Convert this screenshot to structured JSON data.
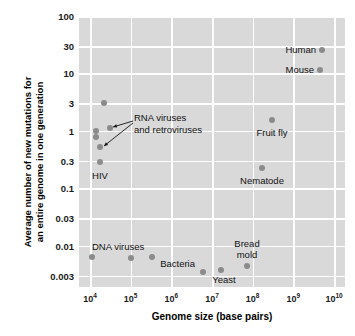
{
  "chart_data": {
    "type": "scatter",
    "title": "",
    "xlabel": "Genome size (base pairs)",
    "ylabel_line1": "Average number of new mutations for",
    "ylabel_line2": "an entire genome in one generation",
    "xscale": "log",
    "yscale": "log",
    "xlim": [
      10000,
      10000000000
    ],
    "ylim": [
      0.0019,
      100
    ],
    "grid": true,
    "legend": "none",
    "xticks": [
      {
        "label": "10",
        "exp": "4",
        "value": 10000
      },
      {
        "label": "10",
        "exp": "5",
        "value": 100000
      },
      {
        "label": "10",
        "exp": "6",
        "value": 1000000
      },
      {
        "label": "10",
        "exp": "7",
        "value": 10000000
      },
      {
        "label": "10",
        "exp": "8",
        "value": 100000000
      },
      {
        "label": "10",
        "exp": "9",
        "value": 1000000000
      },
      {
        "label": "10",
        "exp": "10",
        "value": 10000000000
      }
    ],
    "yticks": [
      {
        "label": "100",
        "value": 100
      },
      {
        "label": "30",
        "value": 30
      },
      {
        "label": "10",
        "value": 10
      },
      {
        "label": "3",
        "value": 3
      },
      {
        "label": "1",
        "value": 1
      },
      {
        "label": "0.3",
        "value": 0.3
      },
      {
        "label": "0.1",
        "value": 0.1
      },
      {
        "label": "0.03",
        "value": 0.03
      },
      {
        "label": "0.01",
        "value": 0.01
      },
      {
        "label": "0.003",
        "value": 0.003
      }
    ],
    "points": [
      {
        "name": "rna-virus-1",
        "x": 14000,
        "y": 2.8,
        "px": 104,
        "py": 103
      },
      {
        "name": "rna-virus-2",
        "x": 27000,
        "y": 0.8,
        "px": 110,
        "py": 128
      },
      {
        "name": "rna-virus-3",
        "x": 11500,
        "y": 0.58,
        "px": 96,
        "py": 131
      },
      {
        "name": "rna-virus-4",
        "x": 11500,
        "y": 0.45,
        "px": 96,
        "py": 137
      },
      {
        "name": "rna-virus-5",
        "x": 13000,
        "y": 0.32,
        "px": 100,
        "py": 147
      },
      {
        "name": "hiv",
        "x": 13000,
        "y": 0.2,
        "px": 100,
        "py": 162
      },
      {
        "name": "dna-virus-1",
        "x": 10800,
        "y": 0.0038,
        "px": 92,
        "py": 257
      },
      {
        "name": "dna-virus-2",
        "x": 78000,
        "y": 0.0032,
        "px": 131,
        "py": 258
      },
      {
        "name": "dna-virus-3",
        "x": 290000,
        "y": 0.0036,
        "px": 152,
        "py": 257
      },
      {
        "name": "bacteria",
        "x": 6500000,
        "y": 0.0021,
        "px": 203,
        "py": 272
      },
      {
        "name": "yeast",
        "x": 17000000,
        "y": 0.0023,
        "px": 221,
        "py": 270
      },
      {
        "name": "bread-mold",
        "x": 60000000,
        "y": 0.0026,
        "px": 247,
        "py": 266
      },
      {
        "name": "nematode",
        "x": 250000000,
        "y": 0.2,
        "px": 262,
        "py": 168
      },
      {
        "name": "fruit-fly",
        "x": 330000000,
        "y": 1.5,
        "px": 272,
        "py": 120
      },
      {
        "name": "mouse",
        "x": 5000000000,
        "y": 12,
        "px": 320,
        "py": 70
      },
      {
        "name": "human",
        "x": 6500000000,
        "y": 26,
        "px": 322,
        "py": 50
      }
    ],
    "point_labels": [
      {
        "name": "human-label",
        "text": "Human",
        "px": 316,
        "py": 50,
        "align": "right"
      },
      {
        "name": "mouse-label",
        "text": "Mouse",
        "px": 314,
        "py": 70,
        "align": "right"
      },
      {
        "name": "fruit-fly-label",
        "text": "Fruit fly",
        "px": 272,
        "py": 133,
        "align": "center"
      },
      {
        "name": "nematode-label",
        "text": "Nematode",
        "px": 262,
        "py": 181,
        "align": "center"
      },
      {
        "name": "hiv-label",
        "text": "HIV",
        "px": 100,
        "py": 176,
        "align": "center"
      },
      {
        "name": "dna-viruses-label",
        "text": "DNA viruses",
        "px": 92,
        "py": 247,
        "align": "left"
      },
      {
        "name": "bacteria-label",
        "text": "Bacteria",
        "px": 195,
        "py": 264,
        "align": "right"
      },
      {
        "name": "yeast-label",
        "text": "Yeast",
        "px": 224,
        "py": 280,
        "align": "center"
      },
      {
        "name": "bread-mold-label-1",
        "text": "Bread",
        "px": 247,
        "py": 244,
        "align": "center"
      },
      {
        "name": "bread-mold-label-2",
        "text": "mold",
        "px": 247,
        "py": 255,
        "align": "center"
      }
    ],
    "annotations": [
      {
        "name": "rna-viruses-annotation",
        "line1": "RNA viruses",
        "line2": "and retroviruses",
        "px": 134,
        "py": 118,
        "arrows": [
          {
            "from_x": 133,
            "from_y": 121,
            "to_x": 113,
            "to_y": 127
          },
          {
            "from_x": 133,
            "from_y": 123,
            "to_x": 104,
            "to_y": 146
          }
        ]
      }
    ],
    "colors": {
      "plot_background": "#d9d9d9",
      "gridline": "#ffffff",
      "marker": "#8b8b8b",
      "text": "#000000",
      "page_background": "#ffffff"
    }
  }
}
